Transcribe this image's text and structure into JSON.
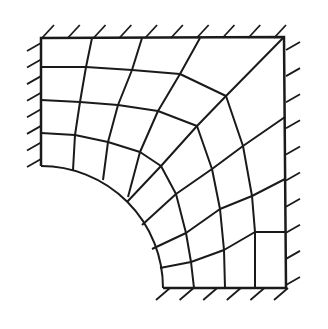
{
  "diagram": {
    "stroke_color": "#1a1a1a",
    "line_width": 2,
    "outer_boundary": {
      "top_left": [
        41,
        38
      ],
      "top_right": [
        284,
        37
      ],
      "bottom_right": [
        286,
        288
      ],
      "arc_start": [
        41,
        166
      ],
      "arc_end": [
        163,
        288
      ]
    },
    "hole_arc": {
      "center": [
        41,
        288
      ],
      "radius": 122
    },
    "mesh_nodes": [
      [
        [
          41,
          166
        ],
        [
          41,
          133
        ],
        [
          41,
          100
        ],
        [
          41,
          67
        ],
        [
          41,
          38
        ]
      ],
      [
        [
          73,
          170
        ],
        [
          75,
          135
        ],
        [
          80,
          102
        ],
        [
          86,
          67
        ],
        [
          92,
          38
        ]
      ],
      [
        [
          103,
          180
        ],
        [
          108,
          142
        ],
        [
          118,
          105
        ],
        [
          132,
          70
        ],
        [
          142,
          38
        ]
      ],
      [
        [
          128,
          197
        ],
        [
          140,
          152
        ],
        [
          158,
          111
        ],
        [
          180,
          74
        ],
        [
          200,
          38
        ]
      ],
      [
        [
          127,
          202
        ],
        [
          161,
          166
        ],
        [
          197,
          126
        ],
        [
          226,
          96
        ],
        [
          284,
          37
        ]
      ],
      [
        [
          142,
          225
        ],
        [
          176,
          194
        ],
        [
          212,
          169
        ],
        [
          243,
          146
        ],
        [
          285,
          117
        ]
      ],
      [
        [
          152,
          249
        ],
        [
          186,
          233
        ],
        [
          220,
          209
        ],
        [
          252,
          196
        ],
        [
          285,
          179
        ]
      ],
      [
        [
          160,
          268
        ],
        [
          191,
          262
        ],
        [
          224,
          250
        ],
        [
          255,
          232
        ],
        [
          286,
          232
        ]
      ],
      [
        [
          163,
          288
        ],
        [
          194,
          288
        ],
        [
          225,
          288
        ],
        [
          255,
          288
        ],
        [
          286,
          288
        ]
      ]
    ],
    "hatch_supports": {
      "top": {
        "y": 38,
        "x_from": 52,
        "x_to": 284,
        "count": 10
      },
      "left": {
        "x": 41,
        "y_from": 50,
        "y_to": 166,
        "count": 8
      },
      "right": {
        "x": 286,
        "y_from": 45,
        "y_to": 280,
        "count": 10
      },
      "bottom": {
        "y": 288,
        "x_from": 168,
        "x_to": 286,
        "count": 6
      }
    }
  }
}
